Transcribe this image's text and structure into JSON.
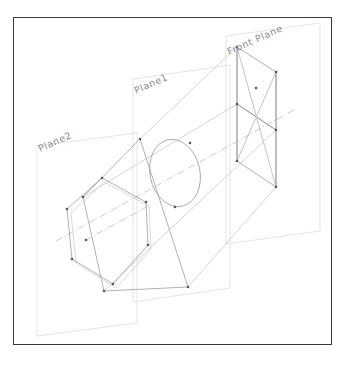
{
  "drawing": {
    "title": "Isometric reference planes with conic projection",
    "frame": {
      "x": 13,
      "y": 17,
      "width": 319,
      "height": 328,
      "stroke_color": "#3a3a3a",
      "stroke_width": 1.4
    },
    "background_color": "#ffffff",
    "palette": {
      "frame": "#3a3a3a",
      "plane_outline": "#d9d9d9",
      "geometry": "#8f8f93",
      "geometry_faint": "#c9c9cd",
      "projection": "#bdbdc2",
      "axis": "#b6b6bb",
      "vertex": "#55555a",
      "label_text": "#8b8b90"
    },
    "labels": [
      {
        "id": "front-plane",
        "text": "Front Plane",
        "x": 229,
        "y": 55,
        "rotation": -24,
        "font_size": 9.5
      },
      {
        "id": "plane1",
        "text": "Plane1",
        "x": 136,
        "y": 94,
        "rotation": -24,
        "font_size": 9.5
      },
      {
        "id": "plane2",
        "text": "Plane2",
        "x": 40,
        "y": 152,
        "rotation": -24,
        "font_size": 9.5
      }
    ],
    "planes": [
      {
        "id": "front-plane-outline",
        "name": "Front Plane",
        "points": "226,36 320,23 320,231 226,244"
      },
      {
        "id": "plane1-outline",
        "name": "Plane1",
        "points": "133,79 230,65 230,288 133,302"
      },
      {
        "id": "plane2-outline",
        "name": "Plane2",
        "points": "37,146 137,133 137,323 37,336"
      }
    ],
    "shapes": {
      "front_quad": {
        "name": "front-plane-quadrilateral",
        "points": "237,47 276,72 276,130 237,104",
        "vertices": [
          [
            237,
            47
          ],
          [
            276,
            72
          ],
          [
            276,
            130
          ],
          [
            237,
            104
          ],
          [
            256,
            88
          ]
        ]
      },
      "front_quad_lower": {
        "name": "front-plane-lower-quad",
        "points": "237,104 276,130 276,187 237,161"
      },
      "circle": {
        "name": "projection-circle",
        "cx": 175,
        "cy": 173,
        "rx": 25,
        "ry": 34,
        "rotation": -12
      },
      "hexagon": {
        "name": "projection-hexagon",
        "points": "67,209 102,178 146,202 148,245 113,284 72,259",
        "vertices": [
          [
            67,
            209
          ],
          [
            102,
            178
          ],
          [
            146,
            202
          ],
          [
            148,
            245
          ],
          [
            113,
            284
          ],
          [
            72,
            259
          ]
        ]
      },
      "hexagon_shadow": {
        "name": "projection-hexagon-shadow",
        "points": "71,213 104,182 149,206 151,249 116,288 76,263"
      },
      "tilted_quad": {
        "name": "tilted-quadrilateral",
        "points": "83,197 140,139 188,287 104,291"
      },
      "axis": {
        "name": "projection-axis",
        "x1": 56,
        "y1": 241,
        "x2": 296,
        "y2": 109
      }
    },
    "projection_rays": [
      {
        "from": [
          140,
          139
        ],
        "to": [
          237,
          47
        ]
      },
      {
        "from": [
          188,
          287
        ],
        "to": [
          276,
          187
        ]
      },
      {
        "from": [
          83,
          197
        ],
        "to": [
          237,
          104
        ]
      },
      {
        "from": [
          104,
          291
        ],
        "to": [
          276,
          130
        ]
      }
    ],
    "vertex_dots": [
      [
        237,
        47
      ],
      [
        276,
        72
      ],
      [
        276,
        130
      ],
      [
        237,
        104
      ],
      [
        256,
        88
      ],
      [
        276,
        187
      ],
      [
        237,
        161
      ],
      [
        140,
        139
      ],
      [
        83,
        197
      ],
      [
        188,
        287
      ],
      [
        104,
        291
      ],
      [
        67,
        209
      ],
      [
        102,
        178
      ],
      [
        146,
        202
      ],
      [
        148,
        245
      ],
      [
        113,
        284
      ],
      [
        72,
        259
      ],
      [
        86,
        240
      ]
    ]
  }
}
